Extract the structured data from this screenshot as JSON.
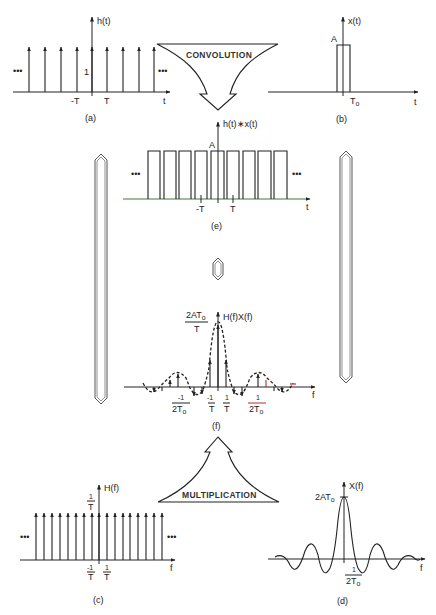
{
  "figure": {
    "panels": {
      "a": {
        "caption": "(a)",
        "y_label": "h(t)",
        "x_label": "t",
        "amplitude_label": "1",
        "ticks": [
          "-T",
          "T"
        ],
        "ellipsis_left": "•••",
        "ellipsis_right": "•••",
        "description": "Periodic impulse train h(t) with unit impulses spaced T apart"
      },
      "b": {
        "caption": "(b)",
        "y_label": "x(t)",
        "x_label": "t",
        "amplitude_label": "A",
        "tick": "T",
        "tick_sub": "o",
        "description": "Rectangular pulse x(t) of amplitude A and half-width To"
      },
      "e": {
        "caption": "(e)",
        "y_label": "h(t)∗x(t)",
        "x_label": "t",
        "amplitude_label": "A",
        "ticks": [
          "-T",
          "T"
        ],
        "ellipsis_left": "•••",
        "ellipsis_right": "•••",
        "description": "Periodic pulse train resulting from convolution"
      },
      "f": {
        "caption": "(f)",
        "y_label": "H(f)X(f)",
        "x_label": "f",
        "peak_label_num": "2AT",
        "peak_label_sub": "o",
        "peak_label_den": "T",
        "ticks": [
          {
            "num": "-1",
            "den": "2T",
            "sub": "o"
          },
          {
            "num": "-1",
            "den": "T",
            "sub": ""
          },
          {
            "num": "1",
            "den": "T",
            "sub": ""
          },
          {
            "num": "1",
            "den": "2T",
            "sub": "o"
          }
        ],
        "description": "Sampled sinc spectrum: impulses weighted by sinc envelope (dashed)"
      },
      "c": {
        "caption": "(c)",
        "y_label": "H(f)",
        "x_label": "f",
        "amplitude_num": "1",
        "amplitude_den": "T",
        "ticks": [
          {
            "num": "-1",
            "den": "T"
          },
          {
            "num": "1",
            "den": "T"
          }
        ],
        "ellipsis_left": "•••",
        "ellipsis_right": "•••",
        "description": "Impulse train in frequency with spacing 1/T and weight 1/T"
      },
      "d": {
        "caption": "(d)",
        "y_label": "X(f)",
        "x_label": "f",
        "peak_label": "2AT",
        "peak_label_sub": "o",
        "tick_num": "1",
        "tick_den": "2T",
        "tick_sub": "o",
        "description": "Sinc spectrum X(f) of rectangular pulse"
      }
    },
    "arrows": {
      "convolution": "CONVOLUTION",
      "multiplication": "MULTIPLICATION"
    },
    "equivalence_symbol": "⇕",
    "colors": {
      "ink": "#222222",
      "axis_tint_e": "#3a7a3a",
      "accent_f": "#b03030",
      "double_line": "#555555"
    }
  }
}
